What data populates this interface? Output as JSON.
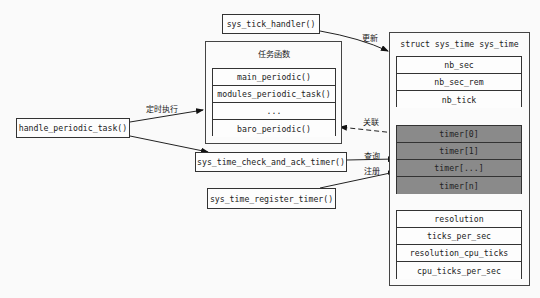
{
  "diagram": {
    "caller": {
      "label": "handle_periodic_task()"
    },
    "tick_handler": {
      "label": "sys_tick_handler()"
    },
    "task_group": {
      "title": "任务函数",
      "items": [
        {
          "label": "main_periodic()"
        },
        {
          "label": "modules_periodic_task()"
        },
        {
          "label": "..."
        },
        {
          "label": "baro_periodic()"
        }
      ]
    },
    "check_timer": {
      "label": "sys_time_check_and_ack_timer()"
    },
    "register_timer": {
      "label": "sys_time_register_timer()"
    },
    "struct": {
      "title": "struct sys_time sys_time",
      "counters": [
        {
          "label": "nb_sec"
        },
        {
          "label": "nb_sec_rem"
        },
        {
          "label": "nb_tick"
        }
      ],
      "timers": [
        {
          "label": "timer[0]"
        },
        {
          "label": "timer[1]"
        },
        {
          "label": "timer[...]"
        },
        {
          "label": "timer[n]"
        }
      ],
      "params": [
        {
          "label": "resolution"
        },
        {
          "label": "ticks_per_sec"
        },
        {
          "label": "resolution_cpu_ticks"
        },
        {
          "label": "cpu_ticks_per_sec"
        }
      ]
    },
    "edges": {
      "scheduled_exec": "定时执行",
      "update": "更新",
      "associate": "关联",
      "query": "查询",
      "register": "注册"
    },
    "colors": {
      "timer_fill": "#8a8a8a",
      "stroke": "#333333",
      "background": "#fafafa"
    }
  }
}
